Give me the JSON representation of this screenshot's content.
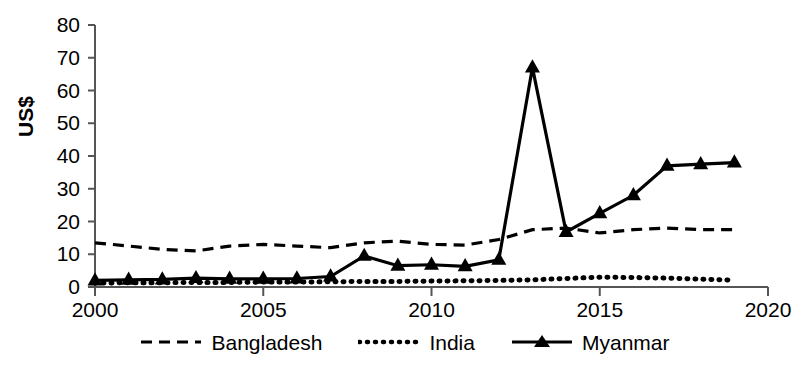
{
  "chart_data": {
    "type": "line",
    "title": "",
    "subtitle": "",
    "xlabel": "",
    "ylabel": "US$",
    "xlim": [
      2000,
      2020
    ],
    "ylim": [
      0,
      80
    ],
    "xticks": [
      2000,
      2005,
      2010,
      2015,
      2020
    ],
    "yticks": [
      0,
      10,
      20,
      30,
      40,
      50,
      60,
      70,
      80
    ],
    "grid": false,
    "legend_position": "bottom",
    "x": [
      2000,
      2001,
      2002,
      2003,
      2004,
      2005,
      2006,
      2007,
      2008,
      2009,
      2010,
      2011,
      2012,
      2013,
      2014,
      2015,
      2016,
      2017,
      2018,
      2019
    ],
    "series": [
      {
        "name": "Bangladesh",
        "style": "dashed",
        "marker": "none",
        "color": "#000000",
        "values": [
          13.5,
          12.5,
          11.5,
          11.0,
          12.5,
          13.0,
          12.5,
          12.0,
          13.5,
          14.0,
          13.0,
          12.8,
          14.5,
          17.5,
          18.0,
          16.5,
          17.5,
          18.0,
          17.5,
          17.5
        ]
      },
      {
        "name": "India",
        "style": "dotted",
        "marker": "none",
        "color": "#000000",
        "values": [
          1.2,
          1.3,
          1.3,
          1.4,
          1.4,
          1.5,
          1.5,
          1.6,
          1.7,
          1.7,
          1.8,
          1.9,
          2.0,
          2.2,
          2.6,
          3.0,
          2.9,
          2.7,
          2.4,
          2.1
        ]
      },
      {
        "name": "Myanmar",
        "style": "solid",
        "marker": "triangle",
        "color": "#000000",
        "values": [
          2.0,
          2.2,
          2.3,
          2.7,
          2.5,
          2.5,
          2.6,
          3.2,
          9.5,
          6.5,
          6.8,
          6.3,
          8.3,
          67.0,
          16.8,
          22.5,
          28.0,
          37.0,
          37.5,
          38.0
        ]
      }
    ]
  },
  "legend": {
    "items": [
      {
        "label": "Bangladesh",
        "style": "dashed"
      },
      {
        "label": "India",
        "style": "dotted"
      },
      {
        "label": "Myanmar",
        "style": "solid-marker"
      }
    ]
  }
}
